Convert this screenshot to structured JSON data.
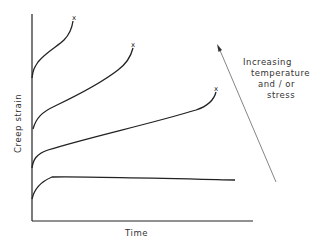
{
  "figure": {
    "type": "creep curves schematic",
    "xlabel": "Time",
    "ylabel": "Creep strain",
    "annotation": {
      "lines": [
        "Increasing",
        "temperature",
        "and / or",
        "stress"
      ],
      "arrow_direction": "up-left"
    },
    "curve_end_marker": "x",
    "curves": [
      {
        "name": "curve-highest",
        "fracture": true
      },
      {
        "name": "curve-high",
        "fracture": true
      },
      {
        "name": "curve-medium",
        "fracture": true
      },
      {
        "name": "curve-lowest",
        "fracture": false
      }
    ],
    "colors": {
      "line": "#222222",
      "text": "#333333",
      "arrow": "#777777"
    }
  }
}
